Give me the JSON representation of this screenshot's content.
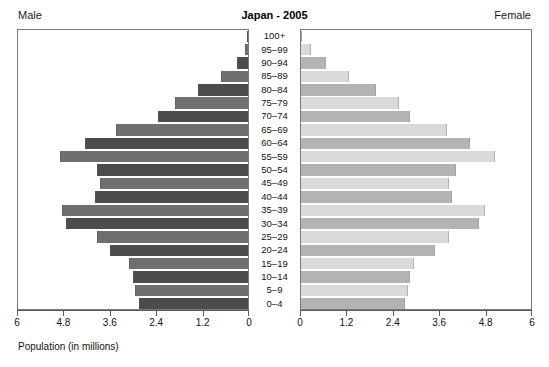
{
  "header": {
    "male_label": "Male",
    "female_label": "Female",
    "title": "Japan - 2005"
  },
  "axis_caption": "Population (in millions)",
  "chart_data": {
    "type": "bar",
    "subtype": "population-pyramid",
    "title": "Japan - 2005",
    "xlabel": "Population (in millions)",
    "ylabel": "",
    "categories": [
      "100+",
      "95–99",
      "90–94",
      "85–89",
      "80–84",
      "75–79",
      "70–74",
      "65–69",
      "60–64",
      "55–59",
      "50–54",
      "45–49",
      "40–44",
      "35–39",
      "30–34",
      "25–29",
      "20–24",
      "15–19",
      "10–14",
      "5–9",
      "0–4"
    ],
    "series": [
      {
        "name": "Male",
        "side": "left",
        "axis_range": [
          6,
          0
        ],
        "tick_labels": [
          "6",
          "4.8",
          "3.6",
          "2.4",
          "1.2",
          "0"
        ],
        "tick_values": [
          6,
          4.8,
          3.6,
          2.4,
          1.2,
          0
        ],
        "values": [
          0.01,
          0.08,
          0.28,
          0.7,
          1.3,
          1.9,
          2.35,
          3.45,
          4.25,
          4.9,
          3.95,
          3.85,
          4.0,
          4.85,
          4.75,
          3.95,
          3.6,
          3.1,
          3.0,
          2.95,
          2.85
        ]
      },
      {
        "name": "Female",
        "side": "right",
        "axis_range": [
          0,
          6
        ],
        "tick_labels": [
          "0",
          "1.2",
          "2.4",
          "3.6",
          "4.8",
          "6"
        ],
        "tick_values": [
          0,
          1.2,
          2.4,
          3.6,
          4.8,
          6
        ],
        "values": [
          0.03,
          0.26,
          0.64,
          1.25,
          1.95,
          2.55,
          2.85,
          3.8,
          4.4,
          5.05,
          4.05,
          3.85,
          3.95,
          4.8,
          4.65,
          3.85,
          3.5,
          2.95,
          2.85,
          2.8,
          2.7
        ]
      }
    ],
    "grid": false,
    "legend": "none",
    "bar_colors": {
      "male_dark": "#4c4c4c",
      "male_light": "#6f6f6f",
      "female_dark": "#b3b3b3",
      "female_light": "#d9d9d9"
    }
  }
}
